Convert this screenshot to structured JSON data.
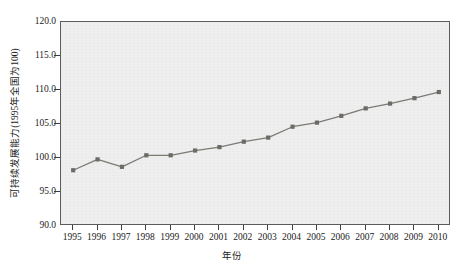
{
  "chart_data": {
    "type": "line",
    "title": "",
    "xlabel": "年份",
    "ylabel": "可持续发展能力(1995年全国为100)",
    "categories": [
      "1995",
      "1996",
      "1997",
      "1998",
      "1999",
      "2000",
      "2001",
      "2002",
      "2003",
      "2004",
      "2005",
      "2006",
      "2007",
      "2008",
      "2009",
      "2010"
    ],
    "values": [
      98.2,
      99.8,
      98.7,
      100.4,
      100.4,
      101.1,
      101.6,
      102.4,
      103.0,
      104.6,
      105.2,
      106.2,
      107.3,
      108.0,
      108.8,
      109.7
    ],
    "series": [
      {
        "name": "可持续发展能力",
        "values": [
          98.2,
          99.8,
          98.7,
          100.4,
          100.4,
          101.1,
          101.6,
          102.4,
          103.0,
          104.6,
          105.2,
          106.2,
          107.3,
          108.0,
          108.8,
          109.7
        ]
      }
    ],
    "ylim": [
      90.0,
      120.0
    ],
    "ytick_labels": [
      "120.0",
      "115.0",
      "110.0",
      "105.0",
      "100.0",
      "95.0",
      "90.0"
    ],
    "ytick_values": [
      120.0,
      115.0,
      110.0,
      105.0,
      100.0,
      95.0,
      90.0
    ],
    "ytick_step": 5.0,
    "xlim": [
      1995,
      2010
    ],
    "grid": false,
    "legend": null,
    "legend_position": "none",
    "marker": "square",
    "line_color": "#7d7a74",
    "marker_color": "#6e6b66",
    "plot_background": "#efeff0",
    "axis_color": "#5c5c5c"
  }
}
